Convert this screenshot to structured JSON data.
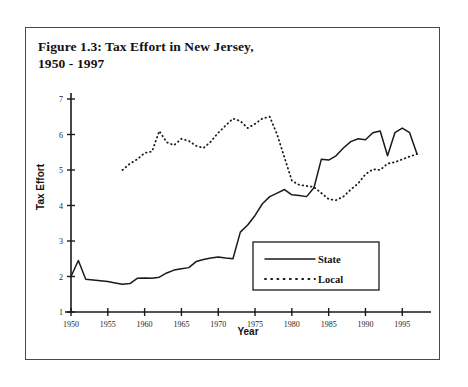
{
  "figure": {
    "caption_line1": "Figure 1.3: Tax Effort in New Jersey,",
    "caption_line2": "1950 - 1997"
  },
  "legend": {
    "position": "inside-bottom-right",
    "entries": [
      {
        "label": "State",
        "style": "solid"
      },
      {
        "label": "Local",
        "style": "dotted"
      }
    ]
  },
  "colors": {
    "line": "#1a1a1a",
    "axis": "#1a1a1a",
    "frame": "#4a4a4a",
    "background": "#ffffff"
  },
  "chart_data": {
    "type": "line",
    "title": "Figure 1.3: Tax Effort in New Jersey, 1950 - 1997",
    "xlabel": "Year",
    "ylabel": "Tax Effort",
    "xlim": [
      1950,
      1997
    ],
    "ylim": [
      1,
      7
    ],
    "grid": false,
    "legend_position": "inside-bottom-right",
    "xticks": [
      1950,
      1955,
      1960,
      1965,
      1970,
      1975,
      1980,
      1985,
      1990,
      1995
    ],
    "yticks": [
      1,
      2,
      3,
      4,
      5,
      6,
      7
    ],
    "series": [
      {
        "name": "State",
        "style": "solid",
        "x": [
          1950,
          1951,
          1952,
          1953,
          1954,
          1955,
          1956,
          1957,
          1958,
          1959,
          1960,
          1961,
          1962,
          1963,
          1964,
          1965,
          1966,
          1967,
          1968,
          1969,
          1970,
          1971,
          1972,
          1973,
          1974,
          1975,
          1976,
          1977,
          1978,
          1979,
          1980,
          1981,
          1982,
          1983,
          1984,
          1985,
          1986,
          1987,
          1988,
          1989,
          1990,
          1991,
          1992,
          1993,
          1994,
          1995,
          1996,
          1997
        ],
        "values": [
          2.0,
          2.45,
          1.92,
          1.9,
          1.88,
          1.86,
          1.82,
          1.78,
          1.8,
          1.95,
          1.96,
          1.95,
          1.98,
          2.1,
          2.18,
          2.22,
          2.25,
          2.42,
          2.48,
          2.52,
          2.55,
          2.52,
          2.5,
          3.25,
          3.45,
          3.72,
          4.05,
          4.25,
          4.35,
          4.45,
          4.3,
          4.28,
          4.25,
          4.5,
          5.3,
          5.28,
          5.4,
          5.62,
          5.8,
          5.88,
          5.85,
          6.05,
          6.1,
          5.4,
          6.05,
          6.18,
          6.05,
          5.45
        ]
      },
      {
        "name": "Local",
        "style": "dotted",
        "x": [
          1957,
          1958,
          1959,
          1960,
          1961,
          1962,
          1963,
          1964,
          1965,
          1966,
          1967,
          1968,
          1969,
          1970,
          1971,
          1972,
          1973,
          1974,
          1975,
          1976,
          1977,
          1978,
          1979,
          1980,
          1981,
          1982,
          1983,
          1984,
          1985,
          1986,
          1987,
          1988,
          1989,
          1990,
          1991,
          1992,
          1993,
          1994,
          1995,
          1996,
          1997
        ],
        "values": [
          5.0,
          5.18,
          5.3,
          5.48,
          5.52,
          6.1,
          5.78,
          5.7,
          5.88,
          5.82,
          5.68,
          5.62,
          5.8,
          6.05,
          6.25,
          6.45,
          6.38,
          6.18,
          6.3,
          6.45,
          6.5,
          6.0,
          5.35,
          4.7,
          4.58,
          4.55,
          4.52,
          4.35,
          4.18,
          4.15,
          4.25,
          4.45,
          4.62,
          4.88,
          5.02,
          5.0,
          5.18,
          5.22,
          5.3,
          5.38,
          5.45
        ]
      }
    ]
  }
}
